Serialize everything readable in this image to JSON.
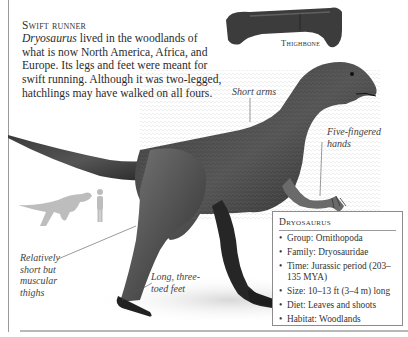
{
  "intro": {
    "heading": "Swift runner",
    "genus": "Dryosaurus",
    "body": " lived in the woodlands of what is now North America, Africa, and Europe. Its legs and feet were meant for swift running. Although it was two-legged, hatchlings may have walked on all fours."
  },
  "labels": {
    "thighbone": "Thighbone",
    "short_arms": "Short arms",
    "five_fingered_hands": [
      "Five-fingered",
      "hands"
    ],
    "thighs": [
      "Relatively",
      "short but",
      "muscular",
      "thighs"
    ],
    "feet": [
      "Long, three-",
      "toed feet"
    ]
  },
  "factbox": {
    "title": "Dryosaurus",
    "facts": [
      "Group: Ornithopoda",
      "Family: Dryosauridae",
      "Time: Jurassic period (203–135 MYA)",
      "Size: 10–13 ft (3–4 m) long",
      "Diet: Leaves and shoots",
      "Habitat: Woodlands"
    ]
  },
  "colors": {
    "skin_dark": "#2b2b2b",
    "skin_mid": "#555555",
    "silhouette": "#bdbdbd",
    "rule": "#9a9a9a"
  }
}
